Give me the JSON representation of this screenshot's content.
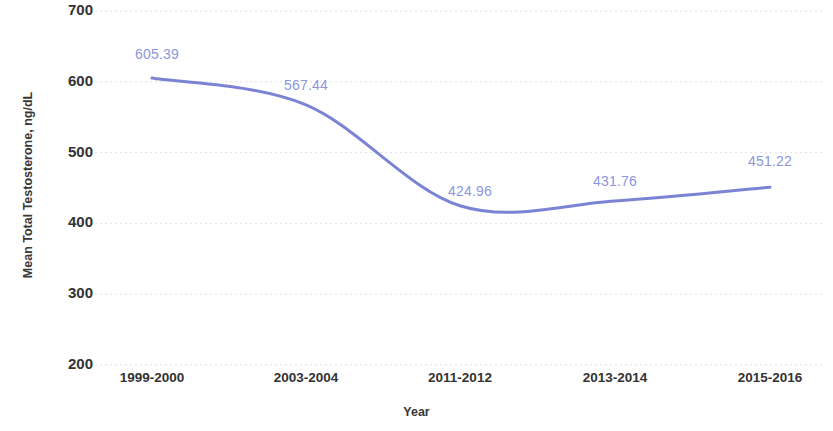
{
  "chart_data": {
    "type": "line",
    "title": "",
    "xlabel": "Year",
    "ylabel": "Mean Total Testosterone, ng/dL",
    "categories": [
      "1999-2000",
      "2003-2004",
      "2011-2012",
      "2013-2014",
      "2015-2016"
    ],
    "values": [
      605.39,
      567.44,
      424.96,
      431.76,
      451.22
    ],
    "point_labels": [
      "605.39",
      "567.44",
      "424.96",
      "431.76",
      "451.22"
    ],
    "yticks": [
      "700",
      "600",
      "500",
      "400",
      "300",
      "200"
    ],
    "ytick_values": [
      700,
      600,
      500,
      400,
      300,
      200
    ],
    "ylim": [
      200,
      700
    ],
    "grid": true,
    "grid_axis": "y",
    "legend": "none",
    "series": [
      {
        "name": "Mean Total Testosterone",
        "values": [
          605.39,
          567.44,
          424.96,
          431.76,
          451.22
        ],
        "color": "#7b84d4",
        "line_style": "smooth",
        "markers": false
      }
    ],
    "colors": {
      "line": "#7b84d4",
      "label_text": "#8b96dd",
      "axis_text": "#333333",
      "gridline": "#e2e2e2",
      "background": "#ffffff"
    }
  },
  "axes": {
    "y_title": "Mean Total Testosterone, ng/dL",
    "x_title": "Year"
  }
}
